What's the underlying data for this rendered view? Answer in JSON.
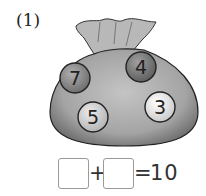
{
  "problem": {
    "number_label": "(1)",
    "balls": [
      {
        "value": "7",
        "shade": "#8a8a8a"
      },
      {
        "value": "4",
        "shade": "#7a7a7a"
      },
      {
        "value": "5",
        "shade": "#d0d0d0"
      },
      {
        "value": "3",
        "shade": "#f0f0f0"
      }
    ],
    "equation": {
      "operator": "+",
      "equals": "=",
      "result": "10"
    }
  },
  "colors": {
    "sack": "#a8a8a8",
    "sack_dark": "#6e6e6e",
    "outline": "#222222"
  }
}
